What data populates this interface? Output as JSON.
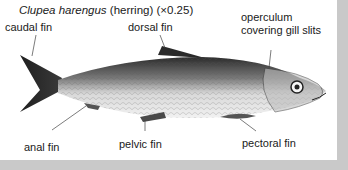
{
  "figure": {
    "title_species": "Clupea harengus",
    "title_rest": "(herring) (×0.25)",
    "labels": {
      "caudal_fin": "caudal fin",
      "dorsal_fin": "dorsal fin",
      "operculum_line1": "operculum",
      "operculum_line2": "covering gill slits",
      "anal_fin": "anal fin",
      "pelvic_fin": "pelvic fin",
      "pectoral_fin": "pectoral fin"
    },
    "colors": {
      "background_frame": "#c9c9c9",
      "panel": "#ffffff",
      "text": "#1a1a1a",
      "fish_dark": "#2a2a2a",
      "fish_light": "#e8e8e8"
    }
  }
}
